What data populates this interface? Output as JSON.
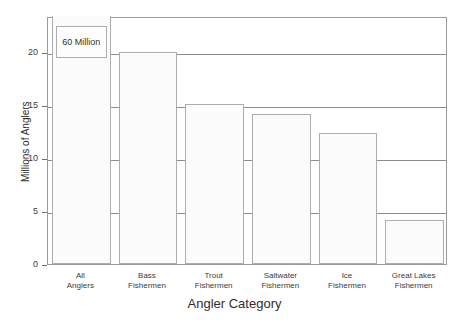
{
  "chart_data": {
    "type": "bar",
    "title": "",
    "subtitle": "",
    "xlabel": "Angler Category",
    "ylabel": "Millions of Anglers",
    "categories": [
      "All Anglers",
      "Bass Fishermen",
      "Trout Fishermen",
      "Saltwater Fishermen",
      "Ice Fishermen",
      "Great Lakes Fishermen"
    ],
    "category_lines": [
      [
        "All",
        "Anglers"
      ],
      [
        "Bass",
        "Fishermen"
      ],
      [
        "Trout",
        "Fishermen"
      ],
      [
        "Saltwater",
        "Fishermen"
      ],
      [
        "Ice",
        "Fishermen"
      ],
      [
        "Great Lakes",
        "Fishermen"
      ]
    ],
    "values": [
      60,
      20.0,
      15.1,
      14.2,
      12.4,
      4.2
    ],
    "truncated_bars": [
      {
        "category": "All Anglers",
        "actual_value": 60,
        "annotation": "60 Million",
        "note": "bar axis-broken; value exceeds plotted y range"
      }
    ],
    "ylim": [
      0,
      23.4
    ],
    "yticks": [
      0,
      5,
      10,
      15,
      20
    ],
    "ytick_labels": [
      "0",
      "5",
      "10",
      "15",
      "20"
    ],
    "grid": true,
    "grid_axis": "y",
    "legend": "none",
    "bar_fill_color": "#fbfbfb",
    "bar_edge_color": "#adadad",
    "gridline_color": "#8c8c8c",
    "frame_color": "#9a9a9a",
    "text_color": "#3b3b3b",
    "background_color": "#ffffff"
  },
  "annotations": {
    "callout_label": "60 Million"
  }
}
